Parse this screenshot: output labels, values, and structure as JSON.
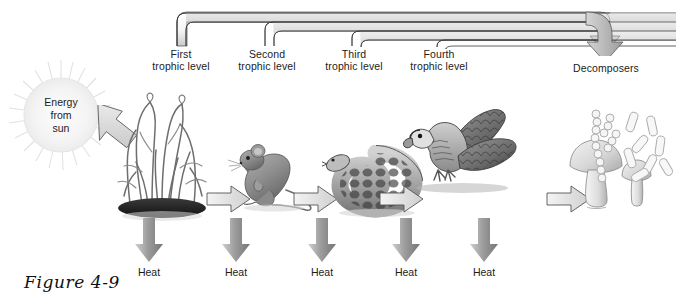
{
  "figure": {
    "caption": "Figure 4-9"
  },
  "sun": {
    "label": "Energy\nfrom\nsun",
    "icon": "sun-icon"
  },
  "brackets": {
    "terminal_label": "Decomposers",
    "levels": [
      {
        "id": "first",
        "label": "First\ntrophic level",
        "tick_x": 177,
        "line_y": 14
      },
      {
        "id": "second",
        "label": "Second\ntrophic level",
        "tick_x": 265,
        "line_y": 22
      },
      {
        "id": "third",
        "label": "Third\ntrophic level",
        "tick_x": 352,
        "line_y": 30
      },
      {
        "id": "fourth",
        "label": "Fourth\ntrophic level",
        "tick_x": 437,
        "line_y": 38
      }
    ]
  },
  "organisms": [
    {
      "id": "producers",
      "name": "grass-tuft",
      "trophic": "First trophic level",
      "x": 160
    },
    {
      "id": "primary-consumer",
      "name": "mouse",
      "trophic": "Second trophic level",
      "x": 255
    },
    {
      "id": "secondary-consumer",
      "name": "snake",
      "trophic": "Third trophic level",
      "x": 345
    },
    {
      "id": "tertiary-consumer",
      "name": "hawk",
      "trophic": "Fourth trophic level",
      "x": 435
    },
    {
      "id": "decomposers",
      "name": "mushroom-and-bacteria",
      "trophic": "Decomposers",
      "x": 605
    }
  ],
  "heat_arrows": [
    {
      "label": "Heat",
      "x": 149
    },
    {
      "label": "Heat",
      "x": 236
    },
    {
      "label": "Heat",
      "x": 322
    },
    {
      "label": "Heat",
      "x": 406
    },
    {
      "label": "Heat",
      "x": 484
    }
  ],
  "flow_arrows": [
    {
      "name": "sun-to-producer-arrow",
      "direction": "down-right"
    },
    {
      "name": "producer-to-mouse-arrow",
      "direction": "right"
    },
    {
      "name": "mouse-to-snake-arrow",
      "direction": "right"
    },
    {
      "name": "snake-to-hawk-arrow",
      "direction": "right"
    },
    {
      "name": "hawk-to-decomposer-arrow",
      "direction": "right"
    }
  ],
  "colors": {
    "text": "#1c1c1c",
    "arrow_fill_light": "#e9e9e9",
    "arrow_fill_dark": "#8d8d8d",
    "arrow_stroke": "#4a4a4a",
    "bracket_stroke": "#3a3a3a",
    "sun_fill": "#f2f2f2",
    "background": "#ffffff"
  }
}
